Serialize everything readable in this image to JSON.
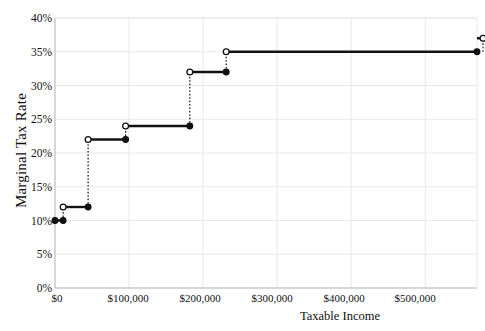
{
  "chart_data": {
    "type": "line",
    "subtype": "step",
    "title": "",
    "xlabel": "Taxable Income",
    "ylabel": "Marginal Tax Rate",
    "xlim": [
      0,
      570000
    ],
    "ylim": [
      0,
      0.4
    ],
    "grid": true,
    "legend": null,
    "x_tick_labels": [
      "$0",
      "$100,000",
      "$200,000",
      "$300,000",
      "$400,000",
      "$500,000"
    ],
    "x_tick_values": [
      0,
      100000,
      200000,
      300000,
      400000,
      500000
    ],
    "y_tick_labels": [
      "0%",
      "5%",
      "10%",
      "15%",
      "20%",
      "25%",
      "30%",
      "35%",
      "40%"
    ],
    "y_tick_values": [
      0,
      5,
      10,
      15,
      20,
      25,
      30,
      35,
      40
    ],
    "series_name": "Marginal tax rate by bracket",
    "steps": [
      {
        "bracket_start": 0,
        "bracket_end": 11000,
        "rate": 10,
        "rate_label": "10%"
      },
      {
        "bracket_start": 11000,
        "bracket_end": 44725,
        "rate": 12,
        "rate_label": "12%"
      },
      {
        "bracket_start": 44725,
        "bracket_end": 95375,
        "rate": 22,
        "rate_label": "22%"
      },
      {
        "bracket_start": 95375,
        "bracket_end": 182100,
        "rate": 24,
        "rate_label": "24%"
      },
      {
        "bracket_start": 182100,
        "bracket_end": 231250,
        "rate": 32,
        "rate_label": "32%"
      },
      {
        "bracket_start": 231250,
        "bracket_end": 578125,
        "rate": 35,
        "rate_label": "35%"
      },
      {
        "bracket_start": 578125,
        "bracket_end": 570000,
        "rate": 37,
        "rate_label": "37%"
      }
    ],
    "marker_style": {
      "closed_endpoint": "filled-circle",
      "open_endpoint": "open-circle",
      "connector": "dotted-vertical"
    },
    "colors": {
      "line": "#111111",
      "grid": "#e8e8e8",
      "axis": "#bbbbbb",
      "text": "#111111",
      "background": "#ffffff"
    }
  }
}
